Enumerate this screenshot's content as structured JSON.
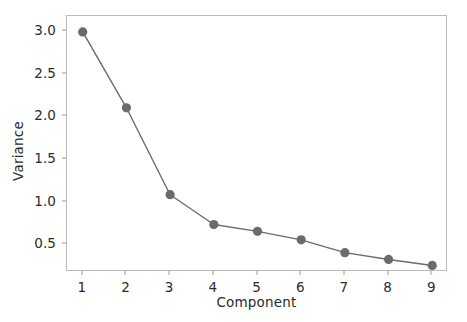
{
  "chart_data": {
    "type": "line",
    "title": "",
    "xlabel": "Component",
    "ylabel": "Variance",
    "x": [
      1,
      2,
      3,
      4,
      5,
      6,
      7,
      8,
      9
    ],
    "values": [
      2.99,
      2.1,
      1.08,
      0.73,
      0.65,
      0.55,
      0.4,
      0.32,
      0.25
    ],
    "categories": [
      "1",
      "2",
      "3",
      "4",
      "5",
      "6",
      "7",
      "8",
      "9"
    ],
    "series": [
      {
        "name": "Variance",
        "values": [
          2.99,
          2.1,
          1.08,
          0.73,
          0.65,
          0.55,
          0.4,
          0.32,
          0.25
        ]
      }
    ],
    "xlim": [
      0.64,
      9.36
    ],
    "ylim": [
      0.173,
      3.177
    ],
    "xticks": [
      1,
      2,
      3,
      4,
      5,
      6,
      7,
      8,
      9
    ],
    "xticklabels": [
      "1",
      "2",
      "3",
      "4",
      "5",
      "6",
      "7",
      "8",
      "9"
    ],
    "yticks": [
      0.5,
      1.0,
      1.5,
      2.0,
      2.5,
      3.0
    ],
    "yticklabels": [
      "0.5",
      "1.0",
      "1.5",
      "2.0",
      "2.5",
      "3.0"
    ],
    "grid": false,
    "legend": null,
    "legend_position": "none",
    "marker": "circle",
    "line_color": "#6b6b6b",
    "marker_color": "#6b6b6b",
    "frame_color": "#b9b9bd",
    "background_color": "#ffffff",
    "text_color": "#2b2b2b"
  }
}
